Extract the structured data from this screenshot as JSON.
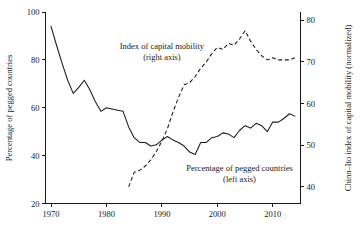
{
  "chart_data": {
    "type": "line",
    "title": "",
    "xlabel": "",
    "ylabel": "Percentage of pegged countries",
    "y2label": "Chinn–Ito index of capital mobility (normalized)",
    "xlim": [
      1969,
      2015
    ],
    "ylim": [
      20,
      100
    ],
    "y2lim": [
      36,
      82
    ],
    "grid": false,
    "legend_position": "inline-annotations",
    "xticks": [
      1970,
      1980,
      1990,
      2000,
      2010
    ],
    "xtick_labels": [
      "1970",
      "1980",
      "1990",
      "2000",
      "2010"
    ],
    "yticks": [
      20,
      40,
      60,
      80,
      100
    ],
    "ytick_labels": [
      "20",
      "40",
      "60",
      "80",
      "100"
    ],
    "y2ticks": [
      40,
      50,
      60,
      70,
      80
    ],
    "y2tick_labels": [
      "40",
      "50",
      "60",
      "70",
      "80"
    ],
    "annotations": [
      {
        "name": "capital-mobility-annotation",
        "line1": "Index of capital mobility",
        "line2": "(right axis)",
        "x": 1990.0,
        "y": 84.5
      },
      {
        "name": "pegged-countries-annotation",
        "line1": "Percentage of pegged countries",
        "line2": "(left axis)",
        "x": 2004.0,
        "y": 33.5
      }
    ],
    "series": [
      {
        "name": "Percentage of pegged countries",
        "axis": "left",
        "style": "solid",
        "x": [
          1970,
          1971,
          1972,
          1973,
          1974,
          1975,
          1976,
          1977,
          1978,
          1979,
          1980,
          1981,
          1982,
          1983,
          1984,
          1985,
          1986,
          1987,
          1988,
          1989,
          1990,
          1991,
          1992,
          1993,
          1994,
          1995,
          1996,
          1997,
          1998,
          1999,
          2000,
          2001,
          2002,
          2003,
          2004,
          2005,
          2006,
          2007,
          2008,
          2009,
          2010,
          2011,
          2012,
          2013,
          2014
        ],
        "values": [
          94.0,
          86.0,
          78.5,
          71.5,
          66.0,
          68.5,
          71.5,
          67.5,
          62.5,
          58.5,
          60.0,
          59.5,
          59.0,
          58.5,
          52.0,
          47.5,
          45.5,
          45.5,
          44.0,
          44.5,
          46.5,
          48.0,
          46.5,
          45.5,
          44.0,
          41.5,
          40.5,
          45.5,
          45.5,
          47.5,
          48.0,
          49.5,
          49.0,
          47.5,
          50.5,
          52.5,
          51.5,
          53.5,
          52.5,
          50.0,
          54.0,
          54.0,
          55.5,
          57.5,
          56.5
        ]
      },
      {
        "name": "Chinn–Ito index of capital mobility (normalized)",
        "axis": "right",
        "style": "dashed",
        "x": [
          1984,
          1985,
          1986,
          1987,
          1988,
          1989,
          1990,
          1991,
          1992,
          1993,
          1994,
          1995,
          1996,
          1997,
          1998,
          1999,
          2000,
          2001,
          2002,
          2003,
          2004,
          2005,
          2006,
          2007,
          2008,
          2009,
          2010,
          2011,
          2012,
          2013,
          2014
        ],
        "values": [
          40.0,
          43.5,
          44.0,
          45.0,
          46.5,
          48.5,
          51.0,
          54.0,
          58.0,
          61.5,
          64.5,
          65.0,
          66.5,
          68.5,
          70.0,
          72.0,
          73.5,
          73.0,
          74.5,
          74.0,
          75.5,
          77.5,
          75.0,
          73.0,
          71.5,
          70.5,
          71.0,
          70.5,
          70.5,
          70.5,
          71.0
        ]
      }
    ]
  }
}
